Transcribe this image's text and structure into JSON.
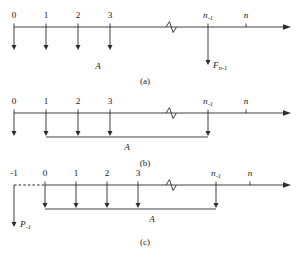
{
  "figure": {
    "line_color": "#2b2b2b",
    "background_color": "#ffffff",
    "axis_arrow": "right-arrowhead",
    "break_symbol": "zigzag-break"
  },
  "panels": [
    {
      "id": "a",
      "caption": "(a)",
      "axis_variable": "n",
      "amount_label": "A",
      "single_flow_label": "F",
      "single_flow_label_sub": "n-1",
      "ticks": [
        {
          "label": "0",
          "sub": "",
          "has_down_arrow": true,
          "long": false
        },
        {
          "label": "1",
          "sub": "",
          "has_down_arrow": true,
          "long": false
        },
        {
          "label": "2",
          "sub": "",
          "has_down_arrow": true,
          "long": false
        },
        {
          "label": "3",
          "sub": "",
          "has_down_arrow": true,
          "long": false
        },
        {
          "label": "n",
          "sub": "-1",
          "has_down_arrow": true,
          "long": true
        },
        {
          "label": "n",
          "sub": "",
          "has_down_arrow": false,
          "long": false
        }
      ],
      "bracket": false
    },
    {
      "id": "b",
      "caption": "(b)",
      "axis_variable": "n",
      "amount_label": "A",
      "ticks": [
        {
          "label": "0",
          "sub": "",
          "has_down_arrow": true,
          "in_bracket": false
        },
        {
          "label": "1",
          "sub": "",
          "has_down_arrow": true,
          "in_bracket": true
        },
        {
          "label": "2",
          "sub": "",
          "has_down_arrow": true,
          "in_bracket": true
        },
        {
          "label": "3",
          "sub": "",
          "has_down_arrow": true,
          "in_bracket": true
        },
        {
          "label": "n",
          "sub": "-1",
          "has_down_arrow": true,
          "in_bracket": true
        },
        {
          "label": "n",
          "sub": "",
          "has_down_arrow": false,
          "in_bracket": false
        }
      ],
      "bracket": true,
      "bracket_from": "1",
      "bracket_to": "n-1"
    },
    {
      "id": "c",
      "caption": "(c)",
      "axis_variable": "n",
      "amount_label": "A",
      "single_flow_label": "P",
      "single_flow_label_sub": "-1",
      "dashed_segment": true,
      "ticks": [
        {
          "label": "-1",
          "sub": "",
          "has_down_arrow": true,
          "in_bracket": false,
          "long": true
        },
        {
          "label": "0",
          "sub": "",
          "has_down_arrow": true,
          "in_bracket": true
        },
        {
          "label": "1",
          "sub": "",
          "has_down_arrow": true,
          "in_bracket": true
        },
        {
          "label": "2",
          "sub": "",
          "has_down_arrow": true,
          "in_bracket": true
        },
        {
          "label": "3",
          "sub": "",
          "has_down_arrow": true,
          "in_bracket": true
        },
        {
          "label": "n",
          "sub": "-1",
          "has_down_arrow": true,
          "in_bracket": true
        },
        {
          "label": "n",
          "sub": "",
          "has_down_arrow": false,
          "in_bracket": false
        }
      ],
      "bracket": true,
      "bracket_from": "0",
      "bracket_to": "n-1"
    }
  ]
}
